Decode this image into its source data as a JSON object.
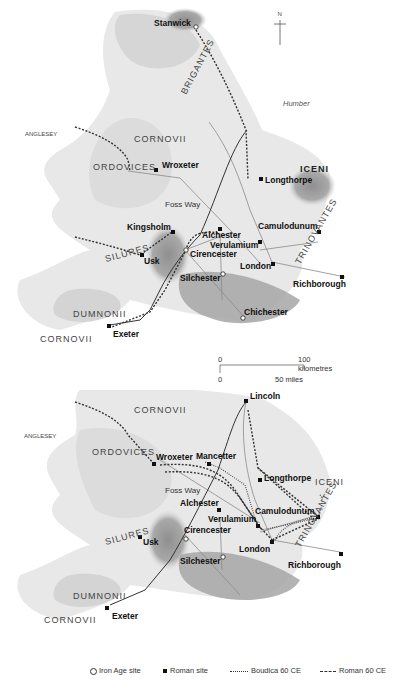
{
  "map_top": {
    "north_label": "N",
    "sea_label": "Humber",
    "sites": [
      {
        "name": "Stanwick",
        "type": "iron_age"
      },
      {
        "name": "Wroxeter",
        "type": "roman"
      },
      {
        "name": "Longthorpe",
        "type": "roman"
      },
      {
        "name": "Kingsholm",
        "type": "roman"
      },
      {
        "name": "Usk",
        "type": "roman"
      },
      {
        "name": "Alchester",
        "type": "roman"
      },
      {
        "name": "Camulodunum",
        "type": "roman"
      },
      {
        "name": "Verulamium",
        "type": "roman"
      },
      {
        "name": "Cirencester",
        "type": "iron_age"
      },
      {
        "name": "London",
        "type": "roman"
      },
      {
        "name": "Silchester",
        "type": "iron_age"
      },
      {
        "name": "Richborough",
        "type": "roman"
      },
      {
        "name": "Chichester",
        "type": "iron_age"
      },
      {
        "name": "Exeter",
        "type": "roman"
      }
    ],
    "tribes": [
      "BRIGANTES",
      "CORNOVII",
      "ORDOVICES",
      "ICENI",
      "SILURES",
      "TRINOVANTES",
      "DUMNONII",
      "CORNOVII"
    ],
    "other_labels": {
      "anglesey": "ANGLESEY",
      "foss_way": "Foss Way"
    },
    "scale": {
      "km_zero": "0",
      "km_label": "100 kilometres",
      "mi_zero": "0",
      "mi_label": "50 miles"
    }
  },
  "map_bottom": {
    "sites": [
      {
        "name": "Lincoln",
        "type": "roman"
      },
      {
        "name": "Wroxeter",
        "type": "roman"
      },
      {
        "name": "Mancetter",
        "type": "roman"
      },
      {
        "name": "Longthorpe",
        "type": "roman"
      },
      {
        "name": "Alchester",
        "type": "roman"
      },
      {
        "name": "Camulodunum",
        "type": "roman"
      },
      {
        "name": "Verulamium",
        "type": "roman"
      },
      {
        "name": "Usk",
        "type": "roman"
      },
      {
        "name": "Cirencester",
        "type": "iron_age"
      },
      {
        "name": "London",
        "type": "roman"
      },
      {
        "name": "Silchester",
        "type": "iron_age"
      },
      {
        "name": "Richborough",
        "type": "roman"
      },
      {
        "name": "Exeter",
        "type": "roman"
      }
    ],
    "tribes": [
      "CORNOVII",
      "ORDOVICES",
      "ICENI",
      "SILURES",
      "TRINOVANTES",
      "DUMNONII",
      "CORNOVII"
    ],
    "other_labels": {
      "anglesey": "ANGLESEY",
      "foss_way": "Foss Way"
    }
  },
  "legend": {
    "iron_age": "Iron Age site",
    "roman": "Roman site",
    "boudica": "Boudica 60 CE",
    "roman_route": "Roman 60 CE"
  },
  "colors": {
    "land": "#e6e6e6",
    "highland": "#cfcfcf",
    "tribal_area": "#9a9a9a",
    "route": "#333333",
    "road": "#888888"
  }
}
